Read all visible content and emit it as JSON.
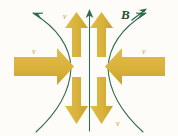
{
  "figure": {
    "background_color": "#fdfcf8",
    "width": 178,
    "height": 136
  },
  "colors": {
    "flow_arrow": "#d9b23a",
    "flow_arrow_shade": "#c9a22e",
    "field_line": "#2f6b4e",
    "field_line_light": "#3c7a5a",
    "label_field": "#1f4d38",
    "label_flow": "#c9a22e"
  },
  "labels": {
    "field_top_right": "B",
    "flow_top_center": "v",
    "flow_left": "v",
    "flow_right": "v",
    "flow_bottom_right": "v"
  },
  "arrows": {
    "inflow_left": {
      "name": "left inflow velocity arrow",
      "direction": "right",
      "label": "v"
    },
    "inflow_right": {
      "name": "right inflow velocity arrow",
      "direction": "left",
      "label": "v"
    },
    "outflow_up_left": {
      "name": "upper-left outflow velocity arrow",
      "direction": "up",
      "label": ""
    },
    "outflow_up_right": {
      "name": "upper-right outflow velocity arrow",
      "direction": "up",
      "label": ""
    },
    "outflow_down_left": {
      "name": "lower-left outflow velocity arrow",
      "direction": "down",
      "label": ""
    },
    "outflow_down_right": {
      "name": "lower-right outflow velocity arrow",
      "direction": "down",
      "label": ""
    },
    "axis": {
      "name": "central vertical axis arrow",
      "direction": "up",
      "label": ""
    }
  },
  "field_lines": {
    "left_curve": {
      "name": "left magnetic field line",
      "arrowhead": "top, pointing up-left"
    },
    "right_curve": {
      "name": "right magnetic field line",
      "arrowhead": "top, pointing up-right",
      "label": "B"
    }
  }
}
